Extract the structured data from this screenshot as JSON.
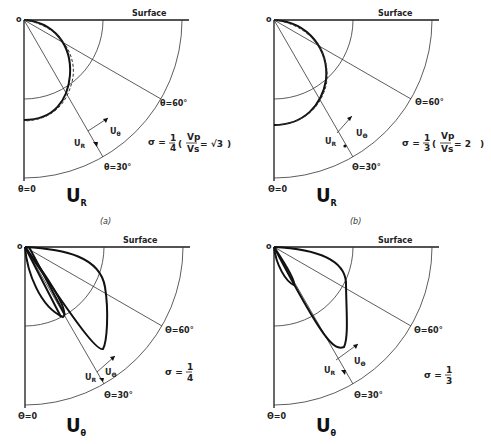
{
  "figure": {
    "panels": [
      {
        "id": "a",
        "origin_label": "o",
        "surface_label": "Surface",
        "theta60_label": "θ=60°",
        "theta30_label": "θ=30°",
        "theta0_label": "θ=0",
        "vector_ur": "U",
        "vector_ur_sub": "R",
        "vector_ut": "U",
        "vector_ut_sub": "θ",
        "component": "U",
        "component_sub": "R",
        "sigma_prefix": "σ = ",
        "sigma_num": "1",
        "sigma_den": "4",
        "ratio_num": "Vp",
        "ratio_den": "Vs",
        "ratio_value": "= √3",
        "caption": "(a)"
      },
      {
        "id": "b",
        "origin_label": "o",
        "surface_label": "Surface",
        "theta60_label": "Θ=60°",
        "theta30_label": "Θ=30°",
        "theta0_label": "Θ=0",
        "vector_ur": "U",
        "vector_ur_sub": "R",
        "vector_ut": "U",
        "vector_ut_sub": "Θ",
        "component": "U",
        "component_sub": "R",
        "sigma_prefix": "σ = ",
        "sigma_num": "1",
        "sigma_den": "3",
        "ratio_num": "Vp",
        "ratio_den": "Vs",
        "ratio_value": "=  2",
        "caption": "(b)"
      },
      {
        "id": "c",
        "origin_label": "o",
        "surface_label": "Surface",
        "theta60_label": "Θ=60°",
        "theta30_label": "Θ=30°",
        "theta0_label": "Θ=0",
        "vector_ur": "U",
        "vector_ur_sub": "R",
        "vector_ut": "U",
        "vector_ut_sub": "Θ",
        "component": "U",
        "component_sub": "θ",
        "sigma_prefix": "σ = ",
        "sigma_num": "1",
        "sigma_den": "4"
      },
      {
        "id": "d",
        "origin_label": "o",
        "surface_label": "Surface",
        "theta60_label": "Θ=60°",
        "theta30_label": "Θ=30°",
        "theta0_label": "Θ=0",
        "vector_ur": "U",
        "vector_ur_sub": "R",
        "vector_ut": "U",
        "vector_ut_sub": "Θ",
        "component": "U",
        "component_sub": "θ",
        "sigma_prefix": "σ = ",
        "sigma_num": "1",
        "sigma_den": "3"
      }
    ]
  }
}
